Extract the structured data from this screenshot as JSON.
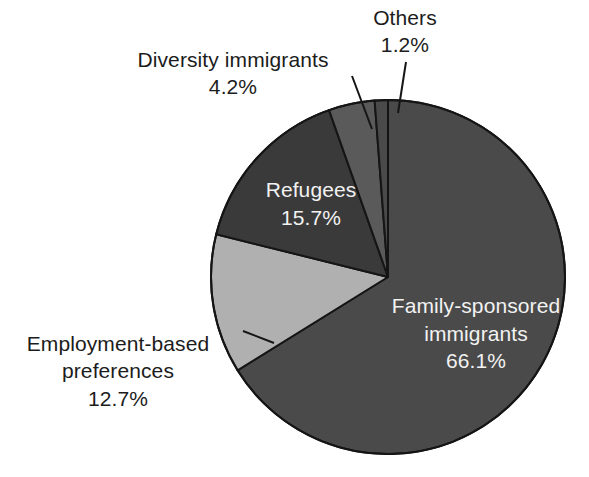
{
  "chart_data": {
    "type": "pie",
    "title": "",
    "subtitle": "",
    "xlabel": "",
    "ylabel": "",
    "legend_position": "none",
    "grid": false,
    "units": "percent",
    "start_angle_deg": 0,
    "direction": "clockwise",
    "categories": [
      "Family-sponsored immigrants",
      "Employment-based preferences",
      "Refugees",
      "Diversity immigrants",
      "Others"
    ],
    "values": [
      66.1,
      12.7,
      15.7,
      4.2,
      1.2
    ],
    "value_labels": [
      "66.1%",
      "12.7%",
      "15.7%",
      "4.2%",
      "1.2%"
    ],
    "colors": [
      "#4a4a4a",
      "#b0b0b0",
      "#3a3a3a",
      "#5a5a5a",
      "#4a4a4a"
    ],
    "slices": [
      {
        "name": "Family-sponsored immigrants",
        "label_line1": "Family-sponsored",
        "label_line2": "immigrants",
        "value": 66.1,
        "value_label": "66.1%",
        "color": "#4a4a4a",
        "label_placement": "inside",
        "label_color": "#f2f2f2",
        "leader_line": false
      },
      {
        "name": "Employment-based preferences",
        "label_line1": "Employment-based",
        "label_line2": "preferences",
        "value": 12.7,
        "value_label": "12.7%",
        "color": "#b0b0b0",
        "label_placement": "outside-left",
        "label_color": "#1c1c1c",
        "leader_line": true
      },
      {
        "name": "Refugees",
        "label_line1": "Refugees",
        "label_line2": "",
        "value": 15.7,
        "value_label": "15.7%",
        "color": "#3a3a3a",
        "label_placement": "inside",
        "label_color": "#f2f2f2",
        "leader_line": false
      },
      {
        "name": "Diversity immigrants",
        "label_line1": "Diversity immigrants",
        "label_line2": "",
        "value": 4.2,
        "value_label": "4.2%",
        "color": "#5a5a5a",
        "label_placement": "outside-top-left",
        "label_color": "#1c1c1c",
        "leader_line": true
      },
      {
        "name": "Others",
        "label_line1": "Others",
        "label_line2": "",
        "value": 1.2,
        "value_label": "1.2%",
        "color": "#4a4a4a",
        "label_placement": "outside-top",
        "label_color": "#1c1c1c",
        "leader_line": true
      }
    ],
    "background_color": "#ffffff",
    "outline_color": "#151515"
  },
  "labels": {
    "others": "Others\n1.2%",
    "diversity": "Diversity immigrants\n4.2%",
    "employment": "Employment-based\npreferences\n12.7%",
    "refugees": "Refugees\n15.7%",
    "family": "Family-sponsored\nimmigrants\n66.1%"
  }
}
